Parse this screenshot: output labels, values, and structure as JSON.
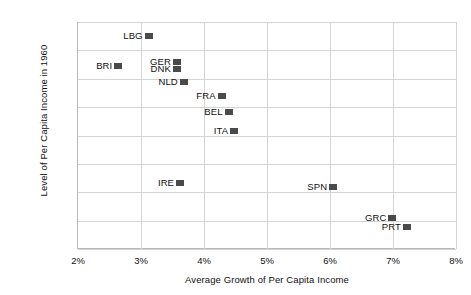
{
  "chart_data": {
    "type": "scatter",
    "title": "",
    "xlabel": "Average Growth of Per Capita Income",
    "ylabel": "Level of Per Capita Income in 1960",
    "xlim": [
      2,
      8
    ],
    "ylim": [
      2000,
      10000
    ],
    "xticks": [
      "2%",
      "3%",
      "4%",
      "5%",
      "6%",
      "7%",
      "8%"
    ],
    "xtick_values": [
      2,
      3,
      4,
      5,
      6,
      7,
      8
    ],
    "yticks": [
      "$2,000",
      "$3,000",
      "$4,000",
      "$5,000",
      "$6,000",
      "$7,000",
      "$8,000",
      "$9,000",
      "$10,000"
    ],
    "ytick_values": [
      2000,
      3000,
      4000,
      5000,
      6000,
      7000,
      8000,
      9000,
      10000
    ],
    "grid": true,
    "legend": "none",
    "marker_color": "#4a4a4a",
    "points": [
      {
        "label": "LBG",
        "x": 3.12,
        "y": 9500,
        "label_side": "left"
      },
      {
        "label": "GER",
        "x": 3.57,
        "y": 8600,
        "label_side": "left"
      },
      {
        "label": "BRI",
        "x": 2.64,
        "y": 8450,
        "label_side": "left"
      },
      {
        "label": "DNK",
        "x": 3.57,
        "y": 8340,
        "label_side": "left"
      },
      {
        "label": "NLD",
        "x": 3.68,
        "y": 7880,
        "label_side": "left"
      },
      {
        "label": "FRA",
        "x": 4.28,
        "y": 7390,
        "label_side": "left"
      },
      {
        "label": "BEL",
        "x": 4.39,
        "y": 6830,
        "label_side": "left"
      },
      {
        "label": "ITA",
        "x": 4.48,
        "y": 6170,
        "label_side": "left"
      },
      {
        "label": "IRE",
        "x": 3.62,
        "y": 4340,
        "label_side": "left"
      },
      {
        "label": "SPN",
        "x": 6.05,
        "y": 4190,
        "label_side": "left"
      },
      {
        "label": "GRC",
        "x": 6.99,
        "y": 3080,
        "label_side": "left"
      },
      {
        "label": "PRT",
        "x": 7.22,
        "y": 2790,
        "label_side": "left"
      }
    ]
  }
}
